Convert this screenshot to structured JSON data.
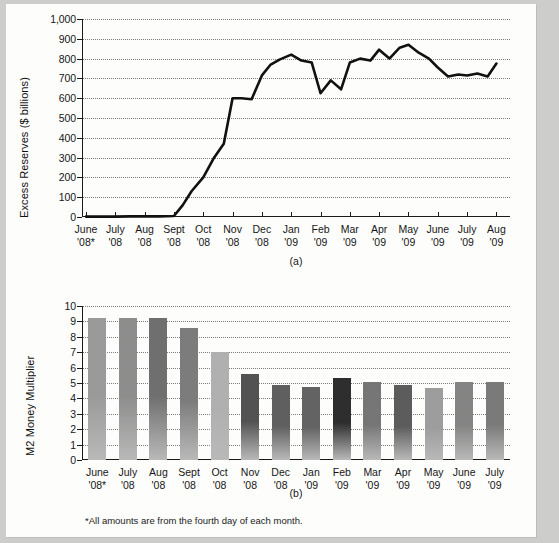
{
  "figure": {
    "footnote": "*All amounts are from the fourth day of each month.",
    "panel_a_caption": "(a)",
    "panel_b_caption": "(b)"
  },
  "chart_data": [
    {
      "type": "line",
      "panel": "(a)",
      "title": "",
      "xlabel": "",
      "ylabel": "Excess Reserves ($ billions)",
      "ylim": [
        0,
        1000
      ],
      "yticks": [
        0,
        100,
        200,
        300,
        400,
        500,
        600,
        700,
        800,
        900,
        1000
      ],
      "ytick_labels": [
        "0",
        "100",
        "200",
        "300",
        "400",
        "500",
        "600",
        "700",
        "800",
        "900",
        "1,000"
      ],
      "grid": true,
      "legend": "none",
      "categories": [
        "June\n'08*",
        "July\n'08",
        "Aug\n'08",
        "Sept\n'08",
        "Oct\n'08",
        "Nov\n'08",
        "Dec\n'08",
        "Jan\n'09",
        "Feb\n'09",
        "Mar\n'09",
        "Apr\n'09",
        "May\n'09",
        "June\n'09",
        "July\n'09",
        "Aug\n'09"
      ],
      "xtick_labels": [
        [
          "June",
          "'08*"
        ],
        [
          "July",
          "'08"
        ],
        [
          "Aug",
          "'08"
        ],
        [
          "Sept",
          "'08"
        ],
        [
          "Oct",
          "'08"
        ],
        [
          "Nov",
          "'08"
        ],
        [
          "Dec",
          "'08"
        ],
        [
          "Jan",
          "'09"
        ],
        [
          "Feb",
          "'09"
        ],
        [
          "Mar",
          "'09"
        ],
        [
          "Apr",
          "'09"
        ],
        [
          "May",
          "'09"
        ],
        [
          "June",
          "'09"
        ],
        [
          "July",
          "'09"
        ],
        [
          "Aug",
          "'09"
        ]
      ],
      "series": [
        {
          "name": "Excess Reserves",
          "color": "#111111",
          "x": [
            0,
            0.5,
            1,
            1.5,
            2,
            2.5,
            3,
            3.3,
            3.6,
            4,
            4.35,
            4.7,
            5,
            5.3,
            5.65,
            6,
            6.3,
            6.6,
            7,
            7.35,
            7.7,
            8,
            8.35,
            8.7,
            9,
            9.35,
            9.7,
            10,
            10.35,
            10.7,
            11,
            11.35,
            11.7,
            12,
            12.35,
            12.7,
            13,
            13.35,
            13.7,
            14
          ],
          "values": [
            2,
            2,
            2,
            3,
            3,
            3,
            5,
            60,
            130,
            200,
            295,
            370,
            600,
            600,
            595,
            715,
            770,
            795,
            820,
            790,
            780,
            625,
            690,
            645,
            780,
            800,
            790,
            845,
            800,
            855,
            870,
            830,
            800,
            755,
            710,
            720,
            715,
            725,
            710,
            775
          ]
        }
      ]
    },
    {
      "type": "bar",
      "panel": "(b)",
      "title": "",
      "xlabel": "",
      "ylabel": "M2 Money Multiplier",
      "ylim": [
        0,
        10
      ],
      "yticks": [
        0,
        1,
        2,
        3,
        4,
        5,
        6,
        7,
        8,
        9,
        10
      ],
      "ytick_labels": [
        "0",
        "1",
        "2",
        "3",
        "4",
        "5",
        "6",
        "7",
        "8",
        "9",
        "10"
      ],
      "grid": true,
      "legend": "none",
      "categories": [
        "June '08*",
        "July '08",
        "Aug '08",
        "Sept '08",
        "Oct '08",
        "Nov '08",
        "Dec '08",
        "Jan '09",
        "Feb '09",
        "Mar '09",
        "Apr '09",
        "May '09",
        "June '09",
        "July '09"
      ],
      "xtick_labels": [
        [
          "June",
          "'08*"
        ],
        [
          "July",
          "'08"
        ],
        [
          "Aug",
          "'08"
        ],
        [
          "Sept",
          "'08"
        ],
        [
          "Oct",
          "'08"
        ],
        [
          "Nov",
          "'08"
        ],
        [
          "Dec",
          "'08"
        ],
        [
          "Jan",
          "'09"
        ],
        [
          "Feb",
          "'09"
        ],
        [
          "Mar",
          "'09"
        ],
        [
          "Apr",
          "'09"
        ],
        [
          "May",
          "'09"
        ],
        [
          "June",
          "'09"
        ],
        [
          "July",
          "'09"
        ]
      ],
      "values": [
        9.2,
        9.2,
        9.2,
        8.6,
        7.0,
        5.6,
        4.85,
        4.75,
        5.3,
        5.05,
        4.85,
        4.65,
        5.05,
        5.05
      ],
      "bar_colors": [
        "#9a9a9a",
        "#8d8d8d",
        "#6f6f6f",
        "#7c7c7c",
        "#b0b0b0",
        "#525252",
        "#5f5f5f",
        "#636363",
        "#2e2e2e",
        "#767676",
        "#5c5c5c",
        "#9d9d9d",
        "#848484",
        "#7a7a7a"
      ]
    }
  ]
}
